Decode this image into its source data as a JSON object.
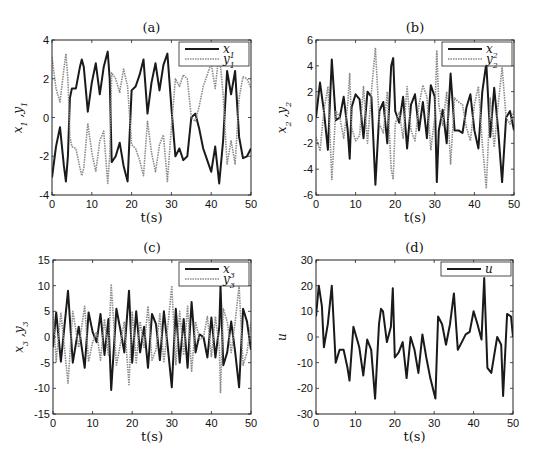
{
  "chart_data": [
    {
      "id": "a",
      "type": "line",
      "title": "(a)",
      "xlabel": "t(s)",
      "ylabel": "x_1 ,y_1",
      "xlim": [
        0,
        50
      ],
      "ylim": [
        -4,
        4
      ],
      "xticks": [
        0,
        10,
        20,
        30,
        40,
        50
      ],
      "yticks": [
        -4,
        -2,
        0,
        2,
        4
      ],
      "legend_position": "upper right",
      "box": [
        52,
        40,
        251,
        195
      ],
      "x": [
        0,
        1,
        2,
        3,
        3.5,
        4,
        4.5,
        5,
        6,
        7,
        7.5,
        8,
        9,
        10,
        11,
        12,
        13,
        14,
        14.5,
        15,
        16,
        17,
        18,
        19,
        20,
        21,
        22,
        23,
        24,
        25,
        26,
        27,
        28,
        29,
        30,
        31,
        32,
        33,
        34,
        35,
        36,
        37,
        38,
        39,
        40,
        41,
        42,
        43,
        44,
        45,
        46,
        47,
        48,
        49,
        50
      ],
      "series": [
        {
          "name": "x_1",
          "style": "solid",
          "values": [
            -3.1,
            -1.5,
            -0.5,
            -2.5,
            -3.3,
            -2.0,
            1.0,
            1.5,
            1.5,
            2.6,
            3.0,
            2.6,
            0.3,
            1.8,
            2.8,
            1.2,
            2.6,
            3.4,
            2.0,
            -2.3,
            -2.0,
            -1.3,
            -2.5,
            -3.3,
            1.4,
            1.6,
            2.2,
            3.0,
            0.2,
            1.8,
            2.8,
            1.4,
            2.7,
            3.3,
            0.5,
            -2.0,
            -1.6,
            -2.2,
            -2.0,
            0.0,
            0.2,
            -0.6,
            -1.6,
            -2.2,
            -2.8,
            -1.5,
            -3.4,
            -1.2,
            2.4,
            1.2,
            2.4,
            -1.0,
            -2.1,
            -2.0,
            -1.6
          ]
        },
        {
          "name": "y_1",
          "style": "dotted",
          "values": [
            3.1,
            1.5,
            0.8,
            2.5,
            3.3,
            2.0,
            -1.0,
            -1.5,
            -1.6,
            -2.6,
            -3.0,
            -2.6,
            -0.3,
            -1.8,
            -2.8,
            -1.2,
            -0.7,
            -3.4,
            -2.0,
            2.3,
            2.0,
            1.3,
            2.5,
            1.6,
            -1.4,
            -1.6,
            -2.2,
            -3.0,
            -0.2,
            -1.8,
            -2.8,
            -1.4,
            -0.9,
            -3.3,
            -0.5,
            2.0,
            1.6,
            2.2,
            2.0,
            0.0,
            -0.2,
            0.6,
            1.6,
            2.2,
            2.8,
            1.5,
            3.4,
            1.2,
            -2.4,
            -1.2,
            -2.4,
            1.0,
            2.1,
            2.0,
            1.5
          ]
        }
      ]
    },
    {
      "id": "b",
      "type": "line",
      "title": "(b)",
      "xlabel": "t(s)",
      "ylabel": "x_2 ,y_2",
      "xlim": [
        0,
        50
      ],
      "ylim": [
        -6,
        6
      ],
      "xticks": [
        0,
        10,
        20,
        30,
        40,
        50
      ],
      "yticks": [
        -6,
        -4,
        -2,
        0,
        2,
        4,
        6
      ],
      "legend_position": "upper right",
      "box": [
        316,
        40,
        514,
        195
      ],
      "x": [
        0,
        1,
        2,
        3,
        4,
        5,
        6,
        7,
        8,
        8.5,
        9,
        10,
        11,
        12,
        13,
        14,
        15,
        16,
        17,
        18,
        19,
        19.5,
        20,
        21,
        22,
        23,
        24,
        25,
        26,
        27,
        28,
        29,
        30,
        30.5,
        31,
        32,
        33,
        34,
        35,
        36,
        37,
        38,
        39,
        40,
        41,
        42,
        43,
        44,
        45,
        46,
        47,
        48,
        49,
        50
      ],
      "series": [
        {
          "name": "x_2",
          "style": "solid",
          "values": [
            0.0,
            2.7,
            0.5,
            -2.5,
            4.5,
            -0.2,
            0.0,
            1.6,
            -1.0,
            -3.2,
            0.8,
            1.8,
            1.4,
            -1.6,
            2.0,
            1.6,
            -5.2,
            0.5,
            1.2,
            -2.0,
            4.0,
            4.6,
            0.5,
            -0.4,
            1.6,
            -2.4,
            1.0,
            1.8,
            -1.0,
            1.2,
            -1.6,
            2.5,
            1.6,
            -5.0,
            -1.0,
            0.6,
            -2.0,
            3.4,
            -1.0,
            -1.0,
            -1.2,
            0.8,
            1.8,
            -1.0,
            -2.4,
            2.0,
            4.2,
            -1.5,
            2.3,
            -1.0,
            -5.0,
            0.0,
            0.5,
            -1.0
          ]
        },
        {
          "name": "y_2",
          "style": "dotted",
          "values": [
            -1.5,
            -2.6,
            0.5,
            2.4,
            -4.8,
            0.5,
            0.0,
            -1.6,
            1.0,
            3.4,
            -0.8,
            -1.8,
            -1.4,
            2.4,
            -2.0,
            2.0,
            5.4,
            -0.5,
            -1.2,
            2.0,
            -4.0,
            -4.8,
            -0.5,
            0.4,
            -1.6,
            2.4,
            -1.0,
            -1.8,
            1.0,
            2.5,
            1.6,
            -2.5,
            0.0,
            5.2,
            1.0,
            -0.6,
            2.0,
            -3.6,
            1.5,
            1.2,
            1.0,
            -0.8,
            -1.8,
            1.0,
            2.4,
            -2.0,
            -5.5,
            1.5,
            -2.3,
            1.0,
            3.9,
            0.0,
            -0.5,
            0.5
          ]
        }
      ]
    },
    {
      "id": "c",
      "type": "line",
      "title": "(c)",
      "xlabel": "t(s)",
      "ylabel": "x_3 ,y_3",
      "xlim": [
        0,
        50
      ],
      "ylim": [
        -15,
        15
      ],
      "xticks": [
        0,
        10,
        20,
        30,
        40,
        50
      ],
      "yticks": [
        -15,
        -10,
        -5,
        0,
        5,
        10,
        15
      ],
      "legend_position": "upper right",
      "box": [
        53,
        260,
        251,
        414
      ],
      "x": [
        0,
        0.8,
        2,
        3.8,
        5,
        6.5,
        8,
        9,
        10,
        11,
        12,
        13,
        14,
        14.7,
        16,
        17,
        18,
        19.2,
        20,
        21,
        22,
        23,
        24,
        25,
        26,
        27,
        28,
        29,
        30,
        31,
        32,
        33,
        34,
        35,
        36,
        37,
        38,
        39,
        40,
        41,
        42,
        42.3,
        43,
        44,
        45,
        46,
        47,
        48,
        49,
        50
      ],
      "series": [
        {
          "name": "x_3",
          "style": "solid",
          "values": [
            -2.0,
            4.8,
            -4.8,
            9.0,
            -5.0,
            2.0,
            -6.0,
            4.8,
            1.0,
            -1.0,
            4.5,
            -3.5,
            3.5,
            -10.3,
            5.5,
            1.5,
            -3.0,
            9.0,
            -5.0,
            5.0,
            -3.0,
            2.0,
            -6.0,
            4.5,
            2.5,
            -4.5,
            5.0,
            -2.0,
            -9.8,
            5.5,
            -5.0,
            3.5,
            -6.0,
            6.8,
            -3.0,
            0.5,
            0.0,
            -4.0,
            3.8,
            -4.0,
            2.0,
            10.0,
            -5.5,
            -3.0,
            3.0,
            -3.0,
            -9.8,
            5.5,
            3.0,
            -2.5
          ]
        },
        {
          "name": "y_3",
          "style": "dotted",
          "values": [
            5.0,
            -4.8,
            4.8,
            -9.0,
            5.0,
            -2.0,
            6.0,
            -4.8,
            -1.0,
            1.0,
            -4.5,
            3.5,
            -3.5,
            10.3,
            -5.5,
            -1.5,
            3.0,
            -9.3,
            5.0,
            -5.0,
            3.0,
            -2.0,
            6.0,
            -4.5,
            -2.5,
            4.5,
            -5.0,
            2.0,
            10.0,
            -5.5,
            5.0,
            -3.5,
            6.0,
            -6.8,
            3.0,
            -0.5,
            0.0,
            4.0,
            -3.8,
            4.0,
            -2.0,
            -10.8,
            5.5,
            3.0,
            -3.0,
            3.0,
            10.0,
            -5.5,
            -3.0,
            2.8
          ]
        }
      ]
    },
    {
      "id": "d",
      "type": "line",
      "title": "(d)",
      "xlabel": "t(s)",
      "ylabel": "u",
      "xlim": [
        0,
        50
      ],
      "ylim": [
        -30,
        30
      ],
      "xticks": [
        0,
        10,
        20,
        30,
        40,
        50
      ],
      "yticks": [
        -30,
        -20,
        -10,
        0,
        10,
        20,
        30
      ],
      "legend_position": "upper right",
      "box": [
        316,
        260,
        513,
        414
      ],
      "x": [
        0,
        0.7,
        1.5,
        2,
        3,
        4,
        5,
        6,
        7,
        8,
        8.5,
        9.5,
        11,
        12,
        13,
        14,
        15,
        16,
        16.5,
        17,
        18,
        19,
        19.5,
        20,
        21,
        22,
        23,
        24,
        25,
        26,
        27,
        28,
        29,
        30.3,
        31,
        32,
        33,
        34,
        35,
        36,
        37,
        38,
        39,
        40,
        41,
        42,
        42.7,
        43.5,
        44.5,
        46,
        47,
        47.5,
        48.5,
        49.5,
        50
      ],
      "series": [
        {
          "name": "u",
          "style": "solid",
          "values": [
            8,
            20,
            12,
            -4,
            5,
            20,
            -10,
            -5,
            -5,
            -12,
            -17,
            4,
            -4,
            -15,
            -1,
            -5,
            -24,
            5,
            11,
            10,
            -2,
            4,
            19,
            -8,
            -6,
            -2,
            -16,
            0,
            -5,
            -14,
            1,
            -8,
            -16,
            -24,
            8,
            5,
            -3,
            5,
            17,
            -5,
            -2,
            1,
            2,
            10,
            5,
            -1,
            23,
            -12,
            -14,
            0,
            -3,
            -23,
            9,
            8,
            0
          ]
        }
      ]
    }
  ]
}
